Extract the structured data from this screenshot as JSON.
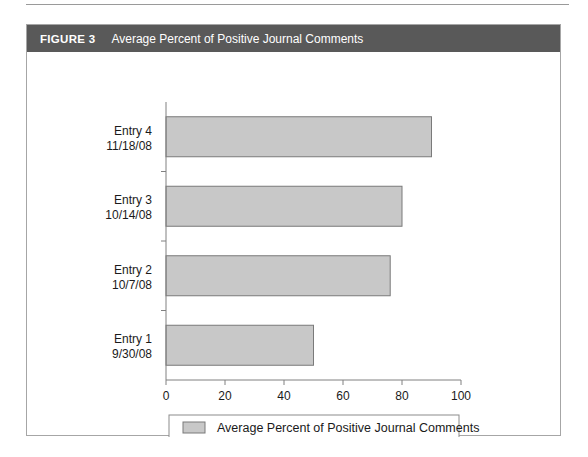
{
  "figure": {
    "label": "FIGURE 3",
    "caption": "Average Percent of Positive Journal Comments",
    "header_bg": "#595959",
    "header_text_color": "#ffffff",
    "frame_border": "#a6a6a6"
  },
  "chart_data": {
    "type": "bar",
    "orientation": "horizontal",
    "title": "Average Percent of Positive Journal Comments",
    "xlabel": "",
    "ylabel": "",
    "xlim": [
      0,
      100
    ],
    "xticks": [
      0,
      20,
      40,
      60,
      80,
      100
    ],
    "xtick_labels": [
      "0",
      "20",
      "40",
      "60",
      "80",
      "100"
    ],
    "grid": false,
    "legend_position": "bottom",
    "bar_color": "#c8c8c8",
    "bar_border_color": "#7a7a7a",
    "categories": [
      "Entry 1\n9/30/08",
      "Entry 2\n10/7/08",
      "Entry 3\n10/14/08",
      "Entry 4\n11/18/08"
    ],
    "category_labels": [
      {
        "name": "Entry 1",
        "date": "9/30/08"
      },
      {
        "name": "Entry 2",
        "date": "10/7/08"
      },
      {
        "name": "Entry 3",
        "date": "10/14/08"
      },
      {
        "name": "Entry 4",
        "date": "11/18/08"
      }
    ],
    "values": [
      50,
      76,
      80,
      90
    ],
    "series": [
      {
        "name": "Average Percent of Positive Journal Comments",
        "values": [
          50,
          76,
          80,
          90
        ]
      }
    ],
    "legend": [
      {
        "label": "Average Percent of Positive Journal Comments",
        "color": "#c8c8c8"
      }
    ]
  }
}
